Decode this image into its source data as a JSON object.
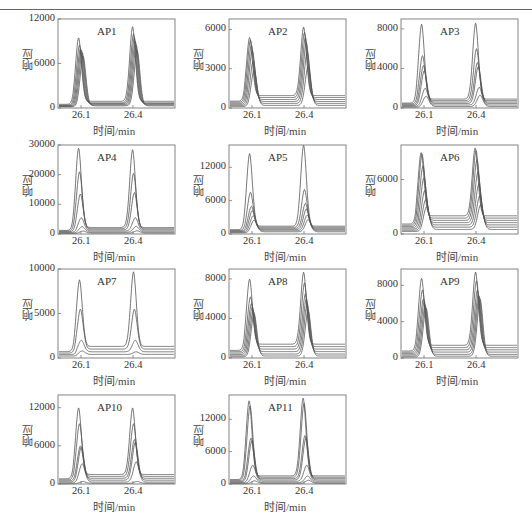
{
  "figure": {
    "xlabel": "时间/min",
    "ylabel": "响应",
    "line_color": "#555555",
    "frame_color": "#777777"
  },
  "chart_data": [
    {
      "type": "line",
      "title": "AP1",
      "xlabel": "时间/min",
      "ylabel": "响应",
      "xticks": [
        "26.1",
        "26.4"
      ],
      "yticks": [
        0,
        6000,
        12000
      ],
      "ylim": [
        0,
        12000
      ],
      "peaks_x": [
        26.1,
        26.4
      ],
      "series_peak_heights": [
        [
          9500,
          11000
        ],
        [
          8500,
          10000
        ],
        [
          8000,
          9500
        ],
        [
          7800,
          9000
        ],
        [
          7500,
          8500
        ],
        [
          7000,
          7800
        ]
      ],
      "baselines": [
        900,
        700,
        600,
        500,
        400,
        300
      ]
    },
    {
      "type": "line",
      "title": "AP2",
      "xlabel": "时间/min",
      "ylabel": "响应",
      "xticks": [
        "26.1",
        "26.4"
      ],
      "yticks": [
        0,
        3000,
        6000
      ],
      "ylim": [
        0,
        6800
      ],
      "peaks_x": [
        26.1,
        26.4
      ],
      "series_peak_heights": [
        [
          5400,
          6200
        ],
        [
          5200,
          5800
        ],
        [
          4800,
          5400
        ],
        [
          4400,
          5000
        ],
        [
          3600,
          4300
        ],
        [
          2900,
          3200
        ]
      ],
      "baselines": [
        950,
        800,
        650,
        500,
        350,
        200
      ]
    },
    {
      "type": "line",
      "title": "AP3",
      "xlabel": "时间/min",
      "ylabel": "响应",
      "xticks": [
        "26.1",
        "26.4"
      ],
      "yticks": [
        0,
        4000,
        8000
      ],
      "ylim": [
        0,
        9000
      ],
      "peaks_x": [
        26.1,
        26.4
      ],
      "series_peak_heights": [
        [
          8500,
          8600
        ],
        [
          5300,
          6000
        ],
        [
          4300,
          4600
        ],
        [
          3800,
          4200
        ],
        [
          2000,
          2100
        ],
        [
          1200,
          1300
        ]
      ],
      "baselines": [
        900,
        750,
        600,
        450,
        300,
        150
      ]
    },
    {
      "type": "line",
      "title": "AP4",
      "xlabel": "时间/min",
      "ylabel": "响应",
      "xticks": [
        "26.1",
        "26.4"
      ],
      "yticks": [
        0,
        10000,
        20000,
        30000
      ],
      "ylim": [
        0,
        30000
      ],
      "peaks_x": [
        26.1,
        26.4
      ],
      "series_peak_heights": [
        [
          29000,
          28500
        ],
        [
          21000,
          20500
        ],
        [
          13500,
          14000
        ],
        [
          5500,
          5500
        ],
        [
          2500,
          2600
        ],
        [
          1000,
          1100
        ]
      ],
      "baselines": [
        2200,
        1800,
        1400,
        1000,
        600,
        300
      ]
    },
    {
      "type": "line",
      "title": "AP5",
      "xlabel": "时间/min",
      "ylabel": "响应",
      "xticks": [
        "26.1",
        "26.4"
      ],
      "yticks": [
        0,
        6000,
        12000
      ],
      "ylim": [
        0,
        16000
      ],
      "peaks_x": [
        26.1,
        26.4
      ],
      "series_peak_heights": [
        [
          14500,
          16000
        ],
        [
          7500,
          8000
        ],
        [
          5000,
          5500
        ],
        [
          4200,
          4500
        ],
        [
          3300,
          3400
        ],
        [
          2500,
          2600
        ]
      ],
      "baselines": [
        1400,
        1200,
        1000,
        800,
        600,
        400
      ]
    },
    {
      "type": "line",
      "title": "AP6",
      "xlabel": "时间/min",
      "ylabel": "响应",
      "xticks": [
        "26.1",
        "26.4"
      ],
      "yticks": [
        0,
        6000
      ],
      "ylim": [
        0,
        9800
      ],
      "peaks_x": [
        26.1,
        26.4
      ],
      "series_peak_heights": [
        [
          9000,
          9500
        ],
        [
          8800,
          9200
        ],
        [
          7500,
          8200
        ],
        [
          6200,
          6800
        ],
        [
          4800,
          5500
        ],
        [
          3800,
          4200
        ],
        [
          3000,
          3200
        ]
      ],
      "baselines": [
        2000,
        1750,
        1500,
        1250,
        1000,
        750,
        500
      ]
    },
    {
      "type": "line",
      "title": "AP7",
      "xlabel": "时间/min",
      "ylabel": "响应",
      "xticks": [
        "26.1",
        "26.4"
      ],
      "yticks": [
        0,
        5000,
        10000
      ],
      "ylim": [
        0,
        10000
      ],
      "peaks_x": [
        26.1,
        26.4
      ],
      "series_peak_heights": [
        [
          8800,
          9700
        ],
        [
          5500,
          5500
        ],
        [
          2000,
          2000
        ],
        [
          800,
          700
        ]
      ],
      "baselines": [
        1300,
        1000,
        700,
        400
      ]
    },
    {
      "type": "line",
      "title": "AP8",
      "xlabel": "时间/min",
      "ylabel": "响应",
      "xticks": [
        "26.1",
        "26.4"
      ],
      "yticks": [
        0,
        4000,
        8000
      ],
      "ylim": [
        0,
        9000
      ],
      "peaks_x": [
        26.1,
        26.4
      ],
      "series_peak_heights": [
        [
          8000,
          8700
        ],
        [
          6200,
          7600
        ],
        [
          5500,
          6500
        ],
        [
          5200,
          6000
        ],
        [
          4800,
          5500
        ],
        [
          4500,
          4800
        ]
      ],
      "baselines": [
        1400,
        1150,
        900,
        650,
        400,
        200
      ]
    },
    {
      "type": "line",
      "title": "AP9",
      "xlabel": "时间/min",
      "ylabel": "响应",
      "xticks": [
        "26.1",
        "26.4"
      ],
      "yticks": [
        0,
        4000,
        8000
      ],
      "ylim": [
        0,
        9800
      ],
      "peaks_x": [
        26.1,
        26.4
      ],
      "series_peak_heights": [
        [
          8800,
          9500
        ],
        [
          7500,
          8500
        ],
        [
          6500,
          7500
        ],
        [
          6200,
          7000
        ],
        [
          5800,
          6800
        ],
        [
          5500,
          6500
        ]
      ],
      "baselines": [
        1400,
        1150,
        900,
        650,
        400,
        200
      ]
    },
    {
      "type": "line",
      "title": "AP10",
      "xlabel": "时间/min",
      "ylabel": "响应",
      "xticks": [
        "26.1",
        "26.4"
      ],
      "yticks": [
        0,
        6000,
        12000
      ],
      "ylim": [
        0,
        14000
      ],
      "peaks_x": [
        26.1,
        26.4
      ],
      "series_peak_heights": [
        [
          12000,
          12000
        ],
        [
          9500,
          9500
        ],
        [
          6000,
          7000
        ],
        [
          5800,
          6600
        ],
        [
          3200,
          3500
        ],
        [
          400,
          400
        ]
      ],
      "baselines": [
        1500,
        1200,
        900,
        600,
        300,
        100
      ]
    },
    {
      "type": "line",
      "title": "AP11",
      "xlabel": "时间/min",
      "ylabel": "响应",
      "xticks": [
        "26.1",
        "26.4"
      ],
      "yticks": [
        0,
        6000,
        12000
      ],
      "ylim": [
        0,
        16500
      ],
      "peaks_x": [
        26.1,
        26.4
      ],
      "series_peak_heights": [
        [
          15500,
          16000
        ],
        [
          14500,
          15000
        ],
        [
          8500,
          9000
        ],
        [
          8000,
          8500
        ],
        [
          3500,
          3500
        ],
        [
          1500,
          1500
        ],
        [
          600,
          700
        ]
      ],
      "baselines": [
        1500,
        1250,
        1000,
        750,
        500,
        250,
        100
      ]
    }
  ],
  "layout": {
    "panels": [
      {
        "left": 0,
        "top": 0
      },
      {
        "left": 171,
        "top": 0
      },
      {
        "left": 343,
        "top": 0
      },
      {
        "left": 0,
        "top": 126
      },
      {
        "left": 171,
        "top": 126
      },
      {
        "left": 343,
        "top": 126
      },
      {
        "left": 0,
        "top": 250
      },
      {
        "left": 171,
        "top": 250
      },
      {
        "left": 343,
        "top": 250
      },
      {
        "left": 0,
        "top": 376
      },
      {
        "left": 171,
        "top": 376
      }
    ]
  }
}
